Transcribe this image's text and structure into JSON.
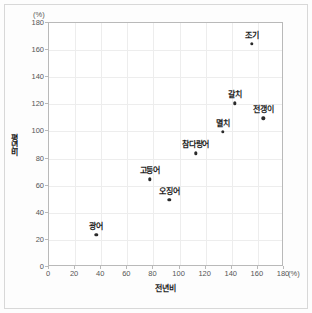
{
  "chart_data": {
    "type": "scatter",
    "title": "",
    "xlabel": "전년비",
    "ylabel": "평년비",
    "x_unit": "(%)",
    "y_unit": "(%)",
    "xlim": [
      0,
      180
    ],
    "ylim": [
      0,
      180
    ],
    "x_ticks": [
      0,
      20,
      40,
      60,
      80,
      100,
      120,
      140,
      160,
      180
    ],
    "y_ticks": [
      0,
      20,
      40,
      60,
      80,
      100,
      120,
      140,
      160,
      180
    ],
    "grid": true,
    "legend": "none",
    "marker_color": "#2b2b2b",
    "points": [
      {
        "label": "광어",
        "x": 37,
        "y": 23
      },
      {
        "label": "고등어",
        "x": 78,
        "y": 64
      },
      {
        "label": "오징어",
        "x": 93,
        "y": 49
      },
      {
        "label": "참다랑어",
        "x": 113,
        "y": 83
      },
      {
        "label": "멸치",
        "x": 134,
        "y": 99
      },
      {
        "label": "갈치",
        "x": 143,
        "y": 120
      },
      {
        "label": "전갱이",
        "x": 165,
        "y": 109
      },
      {
        "label": "조기",
        "x": 156,
        "y": 164
      }
    ]
  }
}
